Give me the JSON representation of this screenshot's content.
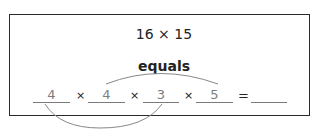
{
  "problem": {
    "expression": "16 × 15",
    "label": "equals",
    "factors": [
      {
        "value": "4"
      },
      {
        "value": "4"
      },
      {
        "value": "3"
      },
      {
        "value": "5"
      }
    ],
    "operator": "×",
    "equals_sign": "=",
    "result": ""
  },
  "colors": {
    "border": "#2a2a2a",
    "text": "#222222",
    "fill_in": "#7d7d7d",
    "arc": "#888888"
  }
}
